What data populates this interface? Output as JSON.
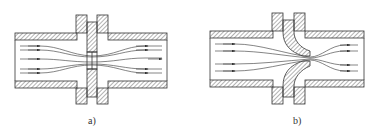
{
  "figures": [
    {
      "id": "a",
      "label": "a)",
      "device": "orifice plate"
    },
    {
      "id": "b",
      "label": "b)",
      "device": "flow nozzle"
    }
  ],
  "colors": {
    "line": "#333333",
    "hatch": "#555555",
    "background": "#ffffff"
  }
}
